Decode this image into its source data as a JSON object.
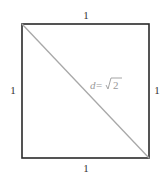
{
  "diagram": {
    "shape": "unit-square",
    "labels": {
      "top": "1",
      "left": "1",
      "right": "1",
      "bottom": "1",
      "diagonal_var": "d",
      "diagonal_eq": " = ",
      "diagonal_value": "2"
    },
    "colors": {
      "square_stroke": "#2a2a2a",
      "diagonal_stroke": "#a8a8a8",
      "label_text": "#333333",
      "diagonal_text": "#9a9a9a"
    }
  }
}
